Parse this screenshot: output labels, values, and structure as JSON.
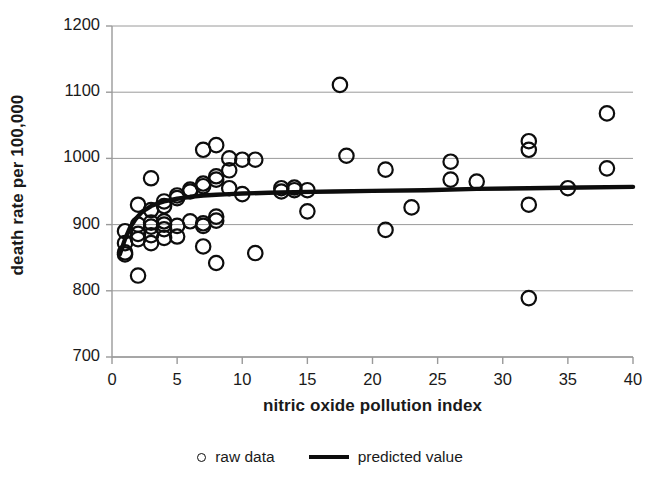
{
  "chart_data": {
    "type": "scatter",
    "title": "",
    "xlabel": "nitric oxide pollution index",
    "ylabel": "death rate per 100,000",
    "xlim": [
      0,
      40
    ],
    "ylim": [
      700,
      1200
    ],
    "xticks": [
      0,
      5,
      10,
      15,
      20,
      25,
      30,
      35,
      40
    ],
    "yticks": [
      700,
      800,
      900,
      1000,
      1100,
      1200
    ],
    "grid": "horizontal",
    "legend_position": "bottom-center",
    "series": [
      {
        "name": "raw data",
        "type": "scatter",
        "marker": "open-circle",
        "color": "#0d0d0d",
        "points": [
          [
            1,
            890
          ],
          [
            1,
            872
          ],
          [
            1,
            858
          ],
          [
            1,
            855
          ],
          [
            2,
            930
          ],
          [
            2,
            900
          ],
          [
            2,
            886
          ],
          [
            2,
            878
          ],
          [
            2,
            823
          ],
          [
            3,
            970
          ],
          [
            3,
            922
          ],
          [
            3,
            903
          ],
          [
            3,
            897
          ],
          [
            3,
            884
          ],
          [
            3,
            872
          ],
          [
            4,
            935
          ],
          [
            4,
            928
          ],
          [
            4,
            905
          ],
          [
            4,
            900
          ],
          [
            4,
            893
          ],
          [
            4,
            880
          ],
          [
            5,
            944
          ],
          [
            5,
            940
          ],
          [
            5,
            898
          ],
          [
            5,
            882
          ],
          [
            6,
            953
          ],
          [
            6,
            950
          ],
          [
            6,
            905
          ],
          [
            7,
            1013
          ],
          [
            7,
            962
          ],
          [
            7,
            958
          ],
          [
            7,
            902
          ],
          [
            7,
            898
          ],
          [
            7,
            867
          ],
          [
            8,
            1020
          ],
          [
            8,
            973
          ],
          [
            8,
            968
          ],
          [
            8,
            912
          ],
          [
            8,
            906
          ],
          [
            8,
            842
          ],
          [
            9,
            1000
          ],
          [
            9,
            982
          ],
          [
            9,
            955
          ],
          [
            10,
            998
          ],
          [
            10,
            946
          ],
          [
            11,
            998
          ],
          [
            11,
            857
          ],
          [
            13,
            955
          ],
          [
            13,
            950
          ],
          [
            14,
            956
          ],
          [
            14,
            952
          ],
          [
            15,
            952
          ],
          [
            15,
            920
          ],
          [
            17.5,
            1111
          ],
          [
            18,
            1004
          ],
          [
            21,
            983
          ],
          [
            21,
            892
          ],
          [
            23,
            926
          ],
          [
            26,
            995
          ],
          [
            26,
            968
          ],
          [
            28,
            965
          ],
          [
            32,
            1026
          ],
          [
            32,
            1013
          ],
          [
            32,
            930
          ],
          [
            32,
            789
          ],
          [
            35,
            955
          ],
          [
            38,
            1068
          ],
          [
            38,
            985
          ]
        ]
      },
      {
        "name": "predicted value",
        "type": "line",
        "color": "#0d0d0d",
        "points": [
          [
            0.6,
            855
          ],
          [
            1,
            878
          ],
          [
            1.4,
            896
          ],
          [
            1.8,
            908
          ],
          [
            2.2,
            917
          ],
          [
            2.6,
            923
          ],
          [
            3,
            928
          ],
          [
            3.5,
            932
          ],
          [
            4,
            935
          ],
          [
            5,
            939
          ],
          [
            6,
            942
          ],
          [
            7,
            944
          ],
          [
            8,
            945
          ],
          [
            9,
            946
          ],
          [
            10,
            947
          ],
          [
            12,
            948
          ],
          [
            14,
            949
          ],
          [
            17,
            950
          ],
          [
            20,
            951
          ],
          [
            24,
            952
          ],
          [
            28,
            954
          ],
          [
            32,
            955
          ],
          [
            36,
            956
          ],
          [
            40,
            957
          ]
        ]
      }
    ]
  },
  "legend": {
    "items": [
      {
        "label": "raw data",
        "marker": "open-circle"
      },
      {
        "label": "predicted value",
        "marker": "line"
      }
    ]
  }
}
